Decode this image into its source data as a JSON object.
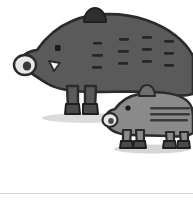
{
  "scene": {
    "title": "Wild boar and piglet illustration",
    "background_color": "#ffffff",
    "width": 193,
    "height": 204
  },
  "palette": {
    "boar_body": "#5a5a5a",
    "boar_outline": "#2b2b2b",
    "boar_stripe": "#262626",
    "piglet_body": "#8a8a8a",
    "piglet_outline": "#2b2b2b",
    "piglet_stripe": "#3a3a3a",
    "hoof": "#4a4a4a",
    "hoof_outline": "#1f1f1f",
    "snout_light": "#e8e8e8",
    "nostril": "#3a3a3a",
    "tusk": "#f2f2f2",
    "eye": "#1a1a1a",
    "shadow": "#cfcfcf",
    "divider": "#d4d4d4"
  },
  "animals": [
    {
      "name": "adult-boar",
      "label": "Adult wild boar",
      "color": "#5a5a5a",
      "facing": "left",
      "stripe_rows": 3,
      "stripe_columns": 4,
      "stripe_count": 12,
      "leg_count": 4,
      "features": [
        "ear",
        "eye",
        "snout",
        "nostril",
        "tusk",
        "hooves"
      ]
    },
    {
      "name": "piglet",
      "label": "Piglet",
      "color": "#8a8a8a",
      "facing": "left",
      "stripe_rows": 3,
      "stripe_columns": 1,
      "stripe_count": 3,
      "leg_count": 4,
      "features": [
        "ear",
        "eye",
        "snout",
        "nostril",
        "hooves"
      ]
    }
  ],
  "footer": {
    "divider_color": "#d4d4d4",
    "divider_y": 193
  }
}
